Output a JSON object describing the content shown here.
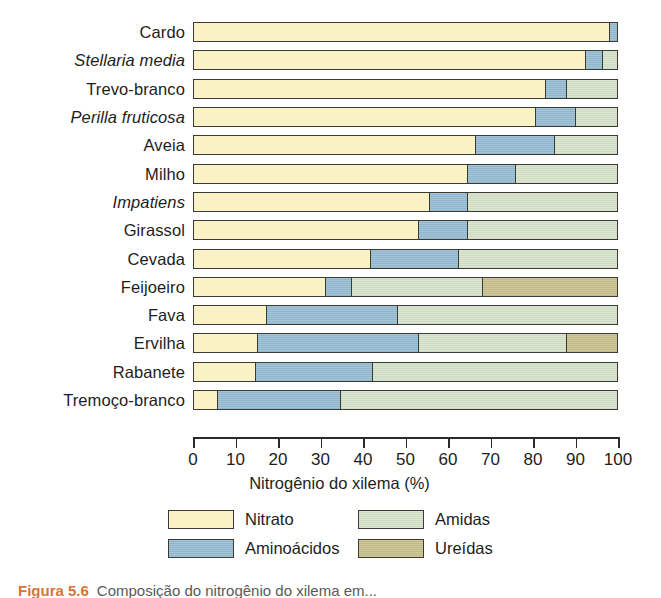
{
  "chart_data": {
    "type": "bar",
    "orientation": "horizontal",
    "stacked": true,
    "title": "",
    "xlabel": "Nitrogênio do xilema (%)",
    "ylabel": "",
    "xlim": [
      0,
      100
    ],
    "xticks": [
      0,
      10,
      20,
      30,
      40,
      50,
      60,
      70,
      80,
      90,
      100
    ],
    "xticklabels": [
      "0",
      "10",
      "20",
      "30",
      "40",
      "50",
      "60",
      "70",
      "80",
      "90",
      "100"
    ],
    "grid": false,
    "legend_position": "bottom",
    "series": [
      {
        "name": "Nitrato",
        "color": "#faf2c4",
        "values": [
          98.0,
          92.5,
          83.0,
          80.5,
          66.5,
          64.5,
          55.5,
          53.0,
          41.5,
          31.0,
          17.0,
          15.0,
          14.5,
          5.5
        ]
      },
      {
        "name": "Aminoácidos",
        "color": "#8fb6cc",
        "values": [
          2.0,
          4.0,
          5.0,
          9.5,
          18.5,
          11.5,
          9.0,
          11.5,
          21.0,
          6.0,
          31.0,
          38.0,
          27.5,
          29.0
        ]
      },
      {
        "name": "Amidas",
        "color": "#cfddc4",
        "values": [
          0.0,
          3.5,
          12.0,
          10.0,
          15.0,
          24.0,
          35.5,
          35.5,
          37.5,
          31.0,
          52.0,
          35.0,
          58.0,
          65.5
        ]
      },
      {
        "name": "Ureídas",
        "color": "#c2bb85",
        "values": [
          0.0,
          0.0,
          0.0,
          0.0,
          0.0,
          0.0,
          0.0,
          0.0,
          0.0,
          32.0,
          0.0,
          12.0,
          0.0,
          0.0
        ]
      }
    ],
    "categories": [
      {
        "label": "Cardo",
        "italic": false
      },
      {
        "label": "Stellaria media",
        "italic": true
      },
      {
        "label": "Trevo-branco",
        "italic": false
      },
      {
        "label": "Perilla fruticosa",
        "italic": true
      },
      {
        "label": "Aveia",
        "italic": false
      },
      {
        "label": "Milho",
        "italic": false
      },
      {
        "label": "Impatiens",
        "italic": true
      },
      {
        "label": "Girassol",
        "italic": false
      },
      {
        "label": "Cevada",
        "italic": false
      },
      {
        "label": "Feijoeiro",
        "italic": false
      },
      {
        "label": "Fava",
        "italic": false
      },
      {
        "label": "Ervilha",
        "italic": false
      },
      {
        "label": "Rabanete",
        "italic": false
      },
      {
        "label": "Tremoço-branco",
        "italic": false
      }
    ],
    "legend": [
      {
        "label": "Nitrato",
        "color": "#faf2c4",
        "class": "nitrato"
      },
      {
        "label": "Amidas",
        "color": "#cfddc4",
        "class": "amidas"
      },
      {
        "label": "Aminoácidos",
        "color": "#8fb6cc",
        "class": "amino"
      },
      {
        "label": "Ureídas",
        "color": "#c2bb85",
        "class": "ureidas"
      }
    ]
  },
  "caption": {
    "number": "Figura 5.6",
    "text": "Composição do nitrogênio do xilema em..."
  }
}
